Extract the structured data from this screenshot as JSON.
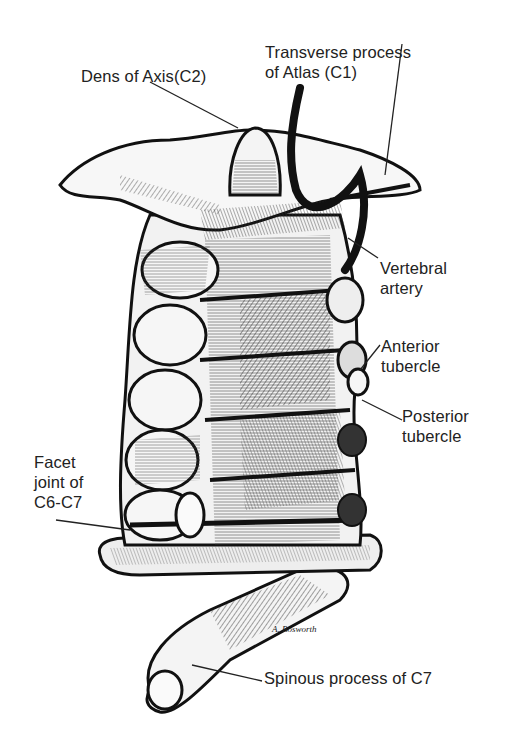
{
  "diagram": {
    "labels": [
      {
        "id": "dens",
        "lines": [
          "Dens of Axis(C2)"
        ],
        "x": 81,
        "y": 64
      },
      {
        "id": "transverse",
        "lines": [
          "Transverse process",
          "of Atlas (C1)"
        ],
        "x": 265,
        "y": 42
      },
      {
        "id": "vertebral-artery",
        "lines": [
          "Vertebral",
          "artery"
        ],
        "x": 380,
        "y": 260
      },
      {
        "id": "anterior-tubercle",
        "lines": [
          "Anterior",
          "tubercle"
        ],
        "x": 380,
        "y": 337
      },
      {
        "id": "posterior-tubercle",
        "lines": [
          "Posterior",
          "tubercle"
        ],
        "x": 402,
        "y": 406
      },
      {
        "id": "facet-joint",
        "lines": [
          "Facet",
          "joint of",
          "C6-C7"
        ],
        "x": 34,
        "y": 452
      },
      {
        "id": "spinous-process",
        "lines": [
          "Spinous process of C7"
        ],
        "x": 264,
        "y": 668
      }
    ],
    "signature": "A. Bosworth",
    "colors": {
      "ink": "#111111",
      "bone": "#f4f4f4",
      "background": "#ffffff",
      "shade": "#555555"
    }
  }
}
